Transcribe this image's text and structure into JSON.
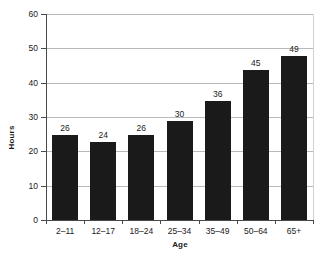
{
  "chart_data": {
    "type": "bar",
    "title": "",
    "subtitle": "",
    "xlabel": "Age",
    "ylabel": "Hours",
    "categories": [
      "2–11",
      "12–17",
      "18–24",
      "25–34",
      "35–49",
      "50–64",
      "65+"
    ],
    "values": [
      26,
      24,
      26,
      30,
      36,
      45,
      49
    ],
    "data_labels": [
      "26",
      "24",
      "26",
      "30",
      "36",
      "45",
      "49"
    ],
    "ylim": [
      0,
      60
    ],
    "y_ticks": [
      0,
      10,
      20,
      30,
      40,
      50,
      60
    ],
    "y_tick_labels": [
      "0",
      "10",
      "20",
      "30",
      "40",
      "50",
      "60"
    ],
    "grid": "horizontal",
    "legend": "none",
    "series": [
      {
        "name": "Hours",
        "values": [
          26,
          24,
          26,
          30,
          36,
          45,
          49
        ]
      }
    ],
    "colors": {
      "bar": "#1a1a1a",
      "gridline": "#b9b9b9",
      "axis": "#4a4a4a",
      "background": "#ffffff",
      "text": "#1a1a1a"
    }
  }
}
